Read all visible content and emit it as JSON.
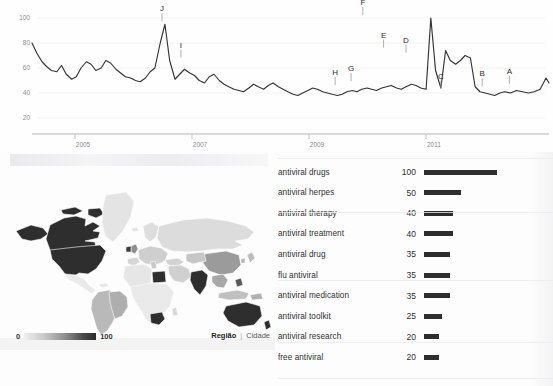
{
  "chart_data": [
    {
      "type": "line",
      "title": "",
      "xlabel": "",
      "ylabel": "",
      "ylim": [
        0,
        105
      ],
      "grid": true,
      "legend": "none",
      "y_ticks": [
        "100",
        "80",
        "60",
        "40",
        "20"
      ],
      "y_tick_values": [
        100,
        80,
        60,
        40,
        20
      ],
      "x_ticks": [
        "2005",
        "2007",
        "2009",
        "2011"
      ],
      "x_tick_values": [
        2005,
        2007,
        2009,
        2011
      ],
      "x_range": [
        2004.0,
        2012.75
      ],
      "series": [
        {
          "name": "antiviral",
          "x": [
            2004.0,
            2004.08,
            2004.17,
            2004.25,
            2004.33,
            2004.42,
            2004.5,
            2004.58,
            2004.67,
            2004.75,
            2004.83,
            2004.92,
            2005.0,
            2005.08,
            2005.17,
            2005.25,
            2005.33,
            2005.42,
            2005.5,
            2005.58,
            2005.67,
            2005.75,
            2005.83,
            2005.92,
            2006.0,
            2006.08,
            2006.17,
            2006.25,
            2006.33,
            2006.42,
            2006.5,
            2006.58,
            2006.67,
            2006.75,
            2006.83,
            2006.92,
            2007.0,
            2007.08,
            2007.17,
            2007.25,
            2007.33,
            2007.42,
            2007.5,
            2007.58,
            2007.67,
            2007.75,
            2007.83,
            2007.92,
            2008.0,
            2008.08,
            2008.17,
            2008.25,
            2008.33,
            2008.42,
            2008.5,
            2008.58,
            2008.67,
            2008.75,
            2008.83,
            2008.92,
            2009.0,
            2009.08,
            2009.17,
            2009.25,
            2009.33,
            2009.42,
            2009.5,
            2009.58,
            2009.67,
            2009.75,
            2009.83,
            2009.92,
            2010.0,
            2010.08,
            2010.17,
            2010.25,
            2010.33,
            2010.42,
            2010.5,
            2010.58,
            2010.67,
            2010.75,
            2010.83,
            2010.92,
            2011.0,
            2011.08,
            2011.17,
            2011.25,
            2011.33,
            2011.42,
            2011.5,
            2011.58,
            2011.67,
            2011.75,
            2011.83,
            2011.92,
            2012.0,
            2012.1,
            2012.2,
            2012.3,
            2012.4,
            2012.5,
            2012.6,
            2012.7,
            2012.75
          ],
          "y": [
            80,
            72,
            65,
            61,
            58,
            57,
            62,
            55,
            51,
            53,
            60,
            65,
            63,
            58,
            60,
            66,
            64,
            59,
            56,
            53,
            52,
            50,
            49,
            52,
            57,
            60,
            80,
            95,
            66,
            51,
            55,
            59,
            56,
            54,
            50,
            48,
            53,
            55,
            50,
            47,
            45,
            43,
            42,
            41,
            44,
            47,
            45,
            43,
            46,
            48,
            45,
            43,
            41,
            39,
            38,
            40,
            42,
            44,
            43,
            41,
            40,
            39,
            38,
            39,
            41,
            42,
            41,
            43,
            44,
            43,
            42,
            44,
            45,
            46,
            44,
            43,
            45,
            47,
            46,
            44,
            43,
            100,
            58,
            44,
            74,
            66,
            63,
            66,
            70,
            68,
            45,
            41,
            40,
            39,
            38,
            40,
            41,
            40,
            42,
            41,
            40,
            41,
            43,
            52,
            48
          ]
        }
      ],
      "annotations": [
        {
          "label": "J",
          "x": 2006.2,
          "y": 95
        },
        {
          "label": "I",
          "x": 2006.52,
          "y": 66
        },
        {
          "label": "H",
          "x": 2009.13,
          "y": 44
        },
        {
          "label": "G",
          "x": 2009.4,
          "y": 47
        },
        {
          "label": "F",
          "x": 2009.6,
          "y": 100
        },
        {
          "label": "E",
          "x": 2009.95,
          "y": 74
        },
        {
          "label": "D",
          "x": 2010.33,
          "y": 70
        },
        {
          "label": "C",
          "x": 2010.92,
          "y": 41
        },
        {
          "label": "B",
          "x": 2011.62,
          "y": 43
        },
        {
          "label": "A",
          "x": 2012.08,
          "y": 45
        }
      ]
    },
    {
      "type": "bar",
      "title": "",
      "orientation": "horizontal",
      "xlabel": "",
      "ylabel": "",
      "xlim": [
        0,
        100
      ],
      "categories": [
        "antiviral drugs",
        "antiviral herpes",
        "antiviral therapy",
        "antiviral treatment",
        "antiviral drug",
        "flu antiviral",
        "antiviral medication",
        "antiviral toolkit",
        "antiviral research",
        "free antiviral"
      ],
      "values": [
        100,
        50,
        40,
        40,
        35,
        35,
        35,
        25,
        20,
        20
      ]
    },
    {
      "type": "heatmap",
      "subtype": "choropleth-world-map",
      "title": "",
      "scale_min_label": "0",
      "scale_max_label": "100",
      "regions": [
        {
          "name": "United States",
          "value": 100
        },
        {
          "name": "Canada",
          "value": 100
        },
        {
          "name": "India",
          "value": 95
        },
        {
          "name": "Australia",
          "value": 95
        },
        {
          "name": "South Africa",
          "value": 90
        },
        {
          "name": "Ireland",
          "value": 85
        },
        {
          "name": "United Kingdom",
          "value": 70
        },
        {
          "name": "Egypt",
          "value": 85
        },
        {
          "name": "New Zealand",
          "value": 80
        },
        {
          "name": "Philippines",
          "value": 65
        },
        {
          "name": "China",
          "value": 45
        },
        {
          "name": "Southeast Asia",
          "value": 45
        },
        {
          "name": "South America",
          "value": 40
        },
        {
          "name": "Europe",
          "value": 30
        },
        {
          "name": "Russia",
          "value": 20
        },
        {
          "name": "Africa",
          "value": 12
        },
        {
          "name": "Greenland",
          "value": 10
        }
      ]
    }
  ],
  "trend_chart": {
    "name": "search-interest-over-time",
    "y_axis": {
      "ticks": [
        {
          "label": "100",
          "value": 100
        },
        {
          "label": "80",
          "value": 80
        },
        {
          "label": "60",
          "value": 60
        },
        {
          "label": "40",
          "value": 40
        },
        {
          "label": "20",
          "value": 20
        }
      ]
    },
    "x_axis": {
      "ticks": [
        {
          "label": "2005",
          "value": 2005
        },
        {
          "label": "2007",
          "value": 2007
        },
        {
          "label": "2009",
          "value": 2009
        },
        {
          "label": "2011",
          "value": 2011
        }
      ]
    }
  },
  "map_panel": {
    "name": "regional-interest-map",
    "legend": {
      "min_label": "0",
      "max_label": "100"
    },
    "scope_toggle": {
      "region_label": "Região",
      "divider": "|",
      "city_label": "Cidade"
    }
  },
  "keyword_panel": {
    "name": "top-related-queries",
    "rows": [
      {
        "label": "antiviral drugs",
        "value": "100",
        "pct": 100
      },
      {
        "label": "antiviral herpes",
        "value": "50",
        "pct": 50
      },
      {
        "label": "antiviral therapy",
        "value": "40",
        "pct": 40
      },
      {
        "label": "antiviral treatment",
        "value": "40",
        "pct": 40
      },
      {
        "label": "antiviral drug",
        "value": "35",
        "pct": 35
      },
      {
        "label": "flu antiviral",
        "value": "35",
        "pct": 35
      },
      {
        "label": "antiviral medication",
        "value": "35",
        "pct": 35
      },
      {
        "label": "antiviral toolkit",
        "value": "25",
        "pct": 25
      },
      {
        "label": "antiviral research",
        "value": "20",
        "pct": 20
      },
      {
        "label": "free antiviral",
        "value": "20",
        "pct": 20
      }
    ]
  },
  "colors": {
    "line": "#333333",
    "bar": "#2e2e2e",
    "axis": "#9a9a9a",
    "grid": "#f0f0f0",
    "map_max": "#2b2b2b",
    "map_min": "#efefef",
    "background": "#fdfdfd"
  }
}
